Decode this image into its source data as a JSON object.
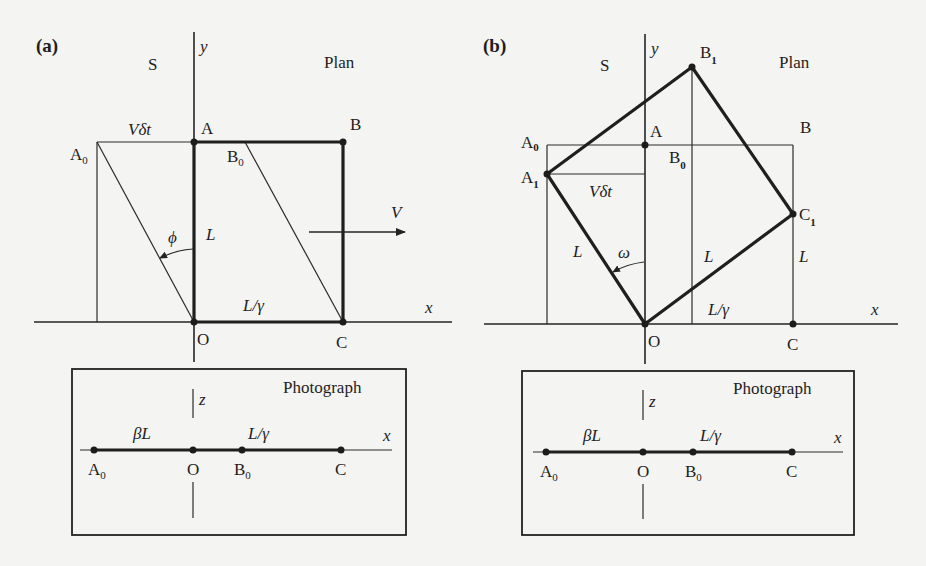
{
  "figure": {
    "panel_a": {
      "tag": "(a)",
      "frame_label": "S",
      "view_label": "Plan",
      "axes": {
        "x": "x",
        "y": "y"
      },
      "points": {
        "A": "A",
        "B": "B",
        "C": "C",
        "O": "O",
        "A0_base": "A",
        "A0_sub": "0",
        "B0_base": "B",
        "B0_sub": "0"
      },
      "labels": {
        "v_dt": "Vδt",
        "L": "L",
        "L_gamma": "L/γ",
        "phi": "ϕ",
        "V": "V"
      },
      "photograph": {
        "title": "Photograph",
        "axes": {
          "x": "x",
          "z": "z"
        },
        "labels": {
          "beta_L": "βL",
          "L_gamma": "L/γ"
        },
        "points": {
          "A0_base": "A",
          "A0_sub": "0",
          "O": "O",
          "B0_base": "B",
          "B0_sub": "0",
          "C": "C"
        }
      }
    },
    "panel_b": {
      "tag": "(b)",
      "frame_label": "S",
      "view_label": "Plan",
      "axes": {
        "x": "x",
        "y": "y"
      },
      "points": {
        "A": "A",
        "B": "B",
        "C": "C",
        "O": "O",
        "A0_base": "A",
        "A0_sub": "0",
        "A1_base": "A",
        "A1_sub": "1",
        "B0_base": "B",
        "B0_sub": "0",
        "B1_base": "B",
        "B1_sub": "1",
        "C1_base": "C",
        "C1_sub": "1"
      },
      "labels": {
        "v_dt": "Vδt",
        "L_left": "L",
        "L_mid": "L",
        "L_right": "L",
        "L_gamma": "L/γ",
        "omega": "ω"
      },
      "photograph": {
        "title": "Photograph",
        "axes": {
          "x": "x",
          "z": "z"
        },
        "labels": {
          "beta_L": "βL",
          "L_gamma": "L/γ"
        },
        "points": {
          "A0_base": "A",
          "A0_sub": "0",
          "O": "O",
          "B0_base": "B",
          "B0_sub": "0",
          "C": "C"
        }
      }
    }
  }
}
